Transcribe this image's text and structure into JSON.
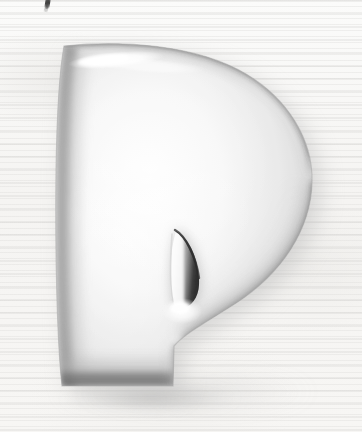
{
  "artwork": {
    "kind": "scanned-illustration",
    "subject": "glossy three-dimensional decorative capital letter P",
    "letter": "P",
    "style": "inflated chrome / airbrushed initial cap",
    "caption": "",
    "canvas": {
      "width": 362,
      "height": 432
    }
  },
  "background": {
    "name": "scanned paper",
    "base_color": "#f7f6f4",
    "highlight_color": "#fbfbfa",
    "shade_color": "#f1f0ee",
    "texture": "faint horizontal scanline banding",
    "scanline_color": "#deddd7"
  },
  "marks": {
    "top_ink_stroke": {
      "name": "stray ink stroke",
      "description": "small dark diagonal pen mark clipped by the top edge",
      "color": "#1e1e1e",
      "x": 45,
      "y": 0
    }
  },
  "glyph": {
    "character": "P",
    "body_color": "#f3f3f3",
    "body_mid_color": "#e2e2e2",
    "edge_color": "#2a2a2a",
    "edge_mid_color": "#8d8d8d",
    "specular_color": "#ffffff",
    "shadow_color": "#bfbfbf",
    "bounds": {
      "left": 56,
      "top": 44,
      "right": 313,
      "bottom": 388
    },
    "parts": [
      {
        "name": "stem",
        "label": "vertical stem"
      },
      {
        "name": "bowl",
        "label": "rounded bowl"
      },
      {
        "name": "counter",
        "label": "leaf-shaped counter"
      },
      {
        "name": "top-highlight",
        "label": "specular highlight band"
      },
      {
        "name": "drop-shadow",
        "label": "soft cast shadow"
      }
    ]
  },
  "chart_data": null
}
